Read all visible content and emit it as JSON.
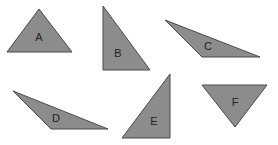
{
  "diagram": {
    "fill_color": "#8c8c8c",
    "stroke_color": "#4a4a4a",
    "label_color": "#222222",
    "triangles": [
      {
        "label": "A",
        "points": "39,9 72,52 7,52",
        "label_x": 39,
        "label_y": 38
      },
      {
        "label": "B",
        "points": "103,6 150,70 103,70",
        "label_x": 118,
        "label_y": 54
      },
      {
        "label": "C",
        "points": "165,20 260,57 202,57",
        "label_x": 208,
        "label_y": 47
      },
      {
        "label": "D",
        "points": "13,91 108,129 51,129",
        "label_x": 56,
        "label_y": 119
      },
      {
        "label": "E",
        "points": "170,74 170,138 122,138",
        "label_x": 154,
        "label_y": 122
      },
      {
        "label": "F",
        "points": "202,85 267,85 235,127",
        "label_x": 235,
        "label_y": 103
      }
    ]
  }
}
